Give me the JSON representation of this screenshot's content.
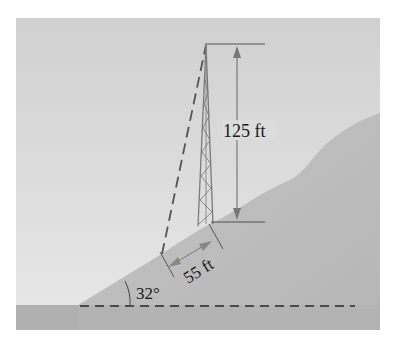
{
  "figure": {
    "type": "trigonometry-diagram",
    "labels": {
      "tower_height": "125 ft",
      "distance_along_slope": "55 ft",
      "slope_angle": "32°"
    },
    "colors": {
      "sky": "#d4d4d4",
      "sky_light": "#e6e6e6",
      "hill": "#bdbdbd",
      "ground": "#b0b0b0",
      "lines": "#6a6a6a",
      "dash": "#2a2a2a",
      "text": "#1a1a1a"
    }
  }
}
